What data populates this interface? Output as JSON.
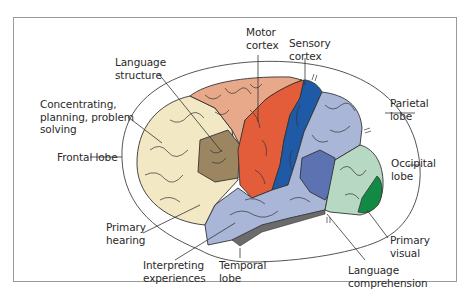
{
  "figure": {
    "type": "labeled brain diagram (lateral view, left hemisphere)",
    "colors": {
      "frontal_lobe": "#f3e8c4",
      "language_structure": "#9c8662",
      "upper_frontal": "#e8a88a",
      "motor_cortex": "#e35d3a",
      "sensory_cortex": "#1f5aa6",
      "parietal_temporal": "#a9b6d8",
      "interior_blue": "#5d72b0",
      "occipital_lobe": "#b7d8c3",
      "primary_visual": "#138a43",
      "underside": "#6b6b6b",
      "outline": "#333333",
      "frame": "#9a9a9a"
    }
  },
  "labels": {
    "motor_cortex": "Motor\ncortex",
    "sensory_cortex": "Sensory\ncortex",
    "language_structure": "Language\nstructure",
    "concentrating": "Concentrating,\nplanning, problem\nsolving",
    "frontal_lobe": "Frontal lobe",
    "parietal_lobe": "Parietal\nlobe",
    "occipital_lobe": "Occipital\nlobe",
    "primary_hearing": "Primary\nhearing",
    "interpreting_experiences": "Interpreting\nexperiences",
    "temporal_lobe": "Temporal\nlobe",
    "primary_visual": "Primary\nvisual",
    "language_comprehension": "Language\ncomprehension"
  }
}
